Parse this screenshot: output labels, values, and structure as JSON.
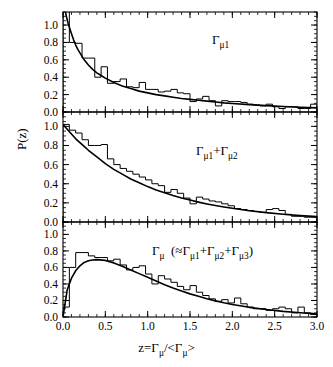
{
  "figure": {
    "axis_label_y": "P(z)",
    "axis_label_x": "z=Γμ/<Γμ>",
    "x_ticks": [
      "0.0",
      "0.5",
      "1.0",
      "1.5",
      "2.0",
      "2.5",
      "3.0"
    ],
    "y_ticks": [
      "0.0",
      "0.2",
      "0.4",
      "0.6",
      "0.8",
      "1.0"
    ],
    "line_color": "#000000",
    "background": "#ffffff"
  },
  "panels": [
    {
      "id": "panel-top",
      "label": "Γμ1",
      "label_main": "Γ",
      "label_sub": "μ1"
    },
    {
      "id": "panel-middle",
      "label": "Γμ1+Γμ2"
    },
    {
      "id": "panel-bottom",
      "label": "Γμ (≈Γμ1+Γμ2+Γμ3)"
    }
  ],
  "chart_data": [
    {
      "type": "bar",
      "title": "Γ_μ1",
      "xlabel": "z=Γ_μ/<Γ_μ>",
      "ylabel": "P(z)",
      "xlim": [
        0.0,
        3.0
      ],
      "ylim": [
        0.0,
        1.15
      ],
      "grid": false,
      "bin_width": 0.075,
      "bin_edges": [
        0.0,
        0.075,
        0.15,
        0.225,
        0.3,
        0.375,
        0.45,
        0.525,
        0.6,
        0.675,
        0.75,
        0.825,
        0.9,
        0.975,
        1.05,
        1.125,
        1.2,
        1.275,
        1.35,
        1.425,
        1.5,
        1.575,
        1.65,
        1.725,
        1.8,
        1.875,
        1.95,
        2.025,
        2.1,
        2.175,
        2.25,
        2.325,
        2.4,
        2.475,
        2.55,
        2.625,
        2.7,
        2.775,
        2.85,
        2.925,
        3.0
      ],
      "values": [
        1.17,
        0.8,
        0.79,
        0.62,
        0.62,
        0.4,
        0.52,
        0.33,
        0.35,
        0.38,
        0.29,
        0.28,
        0.34,
        0.26,
        0.26,
        0.23,
        0.24,
        0.26,
        0.22,
        0.21,
        0.12,
        0.15,
        0.18,
        0.13,
        0.07,
        0.13,
        0.12,
        0.12,
        0.11,
        0.09,
        0.08,
        0.07,
        0.09,
        0.06,
        0.04,
        0.06,
        0.06,
        0.04,
        0.04,
        0.09
      ],
      "curve": {
        "name": "theoretical fit (Porter-Thomas, ν=1)",
        "x": [
          0.0,
          0.02,
          0.04,
          0.06,
          0.08,
          0.1,
          0.125,
          0.15,
          0.175,
          0.2,
          0.25,
          0.3,
          0.35,
          0.4,
          0.45,
          0.5,
          0.6,
          0.7,
          0.8,
          0.9,
          1.0,
          1.1,
          1.2,
          1.3,
          1.4,
          1.5,
          1.6,
          1.7,
          1.8,
          1.9,
          2.0,
          2.2,
          2.4,
          2.6,
          2.8,
          3.0
        ],
        "y": [
          1.3,
          1.2,
          1.1,
          1.02,
          0.96,
          0.9,
          0.83,
          0.77,
          0.72,
          0.68,
          0.6,
          0.54,
          0.49,
          0.45,
          0.42,
          0.39,
          0.34,
          0.3,
          0.27,
          0.24,
          0.22,
          0.2,
          0.185,
          0.17,
          0.155,
          0.145,
          0.135,
          0.125,
          0.115,
          0.105,
          0.098,
          0.085,
          0.073,
          0.063,
          0.054,
          0.047
        ]
      }
    },
    {
      "type": "bar",
      "title": "Γ_μ1+Γ_μ2",
      "xlabel": "z=Γ_μ/<Γ_μ>",
      "ylabel": "P(z)",
      "xlim": [
        0.0,
        3.0
      ],
      "ylim": [
        0.0,
        1.15
      ],
      "grid": false,
      "bin_width": 0.075,
      "bin_edges": [
        0.0,
        0.075,
        0.15,
        0.225,
        0.3,
        0.375,
        0.45,
        0.525,
        0.6,
        0.675,
        0.75,
        0.825,
        0.9,
        0.975,
        1.05,
        1.125,
        1.2,
        1.275,
        1.35,
        1.425,
        1.5,
        1.575,
        1.65,
        1.725,
        1.8,
        1.875,
        1.95,
        2.025,
        2.1,
        2.175,
        2.25,
        2.325,
        2.4,
        2.475,
        2.55,
        2.625,
        2.7,
        2.775,
        2.85,
        2.925,
        3.0
      ],
      "values": [
        1.02,
        0.96,
        0.93,
        0.86,
        0.8,
        0.8,
        0.81,
        0.66,
        0.6,
        0.56,
        0.53,
        0.5,
        0.47,
        0.44,
        0.4,
        0.38,
        0.31,
        0.34,
        0.3,
        0.25,
        0.19,
        0.26,
        0.24,
        0.22,
        0.21,
        0.19,
        0.17,
        0.14,
        0.13,
        0.12,
        0.11,
        0.1,
        0.13,
        0.14,
        0.12,
        0.08,
        0.06,
        0.06,
        0.05,
        0.05
      ],
      "curve": {
        "name": "theoretical fit (χ², ν=2)",
        "x": [
          0.0,
          0.05,
          0.1,
          0.15,
          0.2,
          0.25,
          0.3,
          0.4,
          0.5,
          0.6,
          0.7,
          0.8,
          0.9,
          1.0,
          1.1,
          1.2,
          1.3,
          1.4,
          1.5,
          1.6,
          1.7,
          1.8,
          1.9,
          2.0,
          2.2,
          2.4,
          2.6,
          2.8,
          3.0
        ],
        "y": [
          1.02,
          0.97,
          0.92,
          0.87,
          0.83,
          0.79,
          0.75,
          0.68,
          0.61,
          0.55,
          0.5,
          0.45,
          0.41,
          0.37,
          0.335,
          0.305,
          0.277,
          0.252,
          0.229,
          0.208,
          0.189,
          0.172,
          0.157,
          0.143,
          0.118,
          0.098,
          0.081,
          0.067,
          0.056
        ]
      }
    },
    {
      "type": "bar",
      "title": "Γ_μ (≈Γ_μ1+Γ_μ2+Γ_μ3)",
      "xlabel": "z=Γ_μ/<Γ_μ>",
      "ylabel": "P(z)",
      "xlim": [
        0.0,
        3.0
      ],
      "ylim": [
        0.0,
        1.15
      ],
      "grid": false,
      "bin_width": 0.075,
      "bin_edges": [
        0.0,
        0.075,
        0.15,
        0.225,
        0.3,
        0.375,
        0.45,
        0.525,
        0.6,
        0.675,
        0.75,
        0.825,
        0.9,
        0.975,
        1.05,
        1.125,
        1.2,
        1.275,
        1.35,
        1.425,
        1.5,
        1.575,
        1.65,
        1.725,
        1.8,
        1.875,
        1.95,
        2.025,
        2.1,
        2.175,
        2.25,
        2.325,
        2.4,
        2.475,
        2.55,
        2.625,
        2.7,
        2.775,
        2.85,
        2.925,
        3.0
      ],
      "values": [
        0.12,
        0.6,
        0.78,
        0.78,
        0.74,
        0.72,
        0.72,
        0.68,
        0.7,
        0.63,
        0.57,
        0.6,
        0.62,
        0.52,
        0.4,
        0.5,
        0.46,
        0.42,
        0.37,
        0.33,
        0.38,
        0.3,
        0.26,
        0.22,
        0.19,
        0.21,
        0.17,
        0.23,
        0.16,
        0.12,
        0.1,
        0.1,
        0.08,
        0.1,
        0.12,
        0.1,
        0.05,
        0.12,
        0.05,
        0.03
      ],
      "curve": {
        "name": "theoretical fit (χ², ν=3)",
        "x": [
          0.0,
          0.05,
          0.1,
          0.15,
          0.2,
          0.25,
          0.3,
          0.35,
          0.4,
          0.5,
          0.6,
          0.7,
          0.8,
          0.9,
          1.0,
          1.1,
          1.2,
          1.3,
          1.4,
          1.5,
          1.6,
          1.7,
          1.8,
          1.9,
          2.0,
          2.2,
          2.4,
          2.6,
          2.8,
          3.0
        ],
        "y": [
          0.0,
          0.33,
          0.47,
          0.56,
          0.62,
          0.66,
          0.68,
          0.69,
          0.695,
          0.685,
          0.655,
          0.615,
          0.57,
          0.525,
          0.48,
          0.435,
          0.39,
          0.35,
          0.315,
          0.28,
          0.25,
          0.22,
          0.195,
          0.172,
          0.152,
          0.117,
          0.09,
          0.068,
          0.051,
          0.038
        ]
      }
    }
  ]
}
